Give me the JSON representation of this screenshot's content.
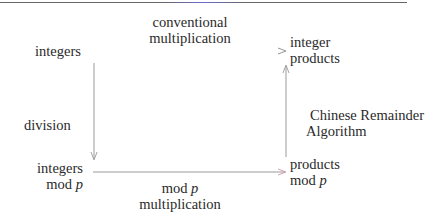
{
  "diagram": {
    "nodes": {
      "top_left": {
        "line1": "integers"
      },
      "top_right": {
        "line1": "integer",
        "line2": "products"
      },
      "bottom_left": {
        "line1": "integers",
        "line2_prefix": "mod ",
        "line2_var": "p"
      },
      "bottom_right": {
        "line1": "products",
        "line2_prefix": "mod ",
        "line2_var": "p"
      }
    },
    "edges": {
      "top": {
        "line1": "conventional",
        "line2": "multiplication",
        "from": "integers",
        "to": "integer products"
      },
      "left": {
        "line1": "division",
        "from": "integers",
        "to": "integers mod p"
      },
      "bottom": {
        "line1_prefix": "mod ",
        "line1_var": "p",
        "line2": "multiplication",
        "from": "integers mod p",
        "to": "products mod p"
      },
      "right": {
        "line1": "Chinese Remainder",
        "line2": "Algorithm",
        "from": "products mod p",
        "to": "integer products"
      }
    },
    "colors": {
      "text": "#2a2a2a",
      "arrow": "#888888",
      "rule": "#666666"
    }
  }
}
